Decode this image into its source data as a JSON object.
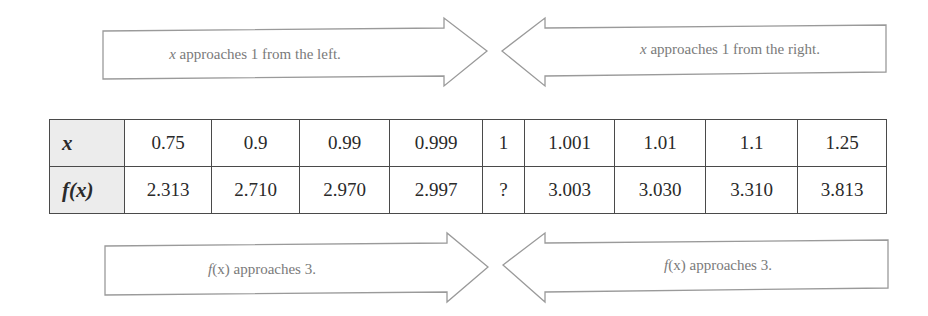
{
  "arrows": {
    "top_left": {
      "var": "x",
      "text": " approaches 1 from the left.",
      "direction": "right"
    },
    "top_right": {
      "var": "x",
      "text": " approaches 1 from the right.",
      "direction": "left"
    },
    "bottom_left": {
      "var": "f",
      "paren": "(x)",
      "text": " approaches 3.",
      "direction": "right"
    },
    "bottom_right": {
      "var": "f",
      "paren": "(x)",
      "text": " approaches 3.",
      "direction": "left"
    }
  },
  "table": {
    "row_headers": [
      "x",
      "f(x)"
    ],
    "x_values": [
      "0.75",
      "0.9",
      "0.99",
      "0.999",
      "1",
      "1.001",
      "1.01",
      "1.1",
      "1.25"
    ],
    "fx_values": [
      "2.313",
      "2.710",
      "2.970",
      "2.997",
      "?",
      "3.003",
      "3.030",
      "3.310",
      "3.813"
    ]
  },
  "colors": {
    "arrow_stroke": "#9a9a9a",
    "arrow_text": "#7a7a7a",
    "table_border": "#4a4a4a",
    "header_fill": "#ececec"
  }
}
